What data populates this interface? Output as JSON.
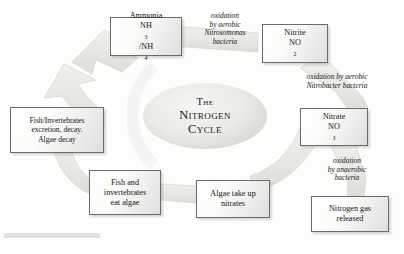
{
  "figure": {
    "title_lines": [
      "The",
      "Nitrogen",
      "Cycle"
    ],
    "center_title_plain": "The Nitrogen Cycle",
    "style": {
      "arrow_fill": "#e7e7e4",
      "arrow_stroke": "#d2d2ce",
      "box_border": "#6b6b6b",
      "text_color": "#141414",
      "background": "#fdfdfc"
    }
  },
  "nodes": [
    {
      "id": "ammonia",
      "line1": "Ammonia",
      "line2_html": "NH3/NH4",
      "line2_base": "NH",
      "line2_sub1": "3",
      "line2_mid": "/NH",
      "line2_sub2": "4"
    },
    {
      "id": "nitrite",
      "line1": "Nitrite",
      "line2_base": "NO",
      "line2_sub1": "2"
    },
    {
      "id": "nitrate",
      "line1": "Nitrate",
      "line2_base": "NO",
      "line2_sub1": "3"
    },
    {
      "id": "nitrogen-gas",
      "line1": "Nitrogen gas",
      "line2": "released"
    },
    {
      "id": "algae-uptake",
      "line1": "Algae take up",
      "line2": "nitrates"
    },
    {
      "id": "fish-eat",
      "line1": "Fish and",
      "line2": "invertebrates",
      "line3": "eat algae"
    },
    {
      "id": "fish-excrete",
      "line1": "Fish/Invertebrates",
      "line2": "excretion, decay.",
      "line3": "Algae decay"
    }
  ],
  "annotations": [
    {
      "id": "nitrosomonas",
      "lines": [
        "oxidation",
        "by aerobic",
        "Nitrosomonas",
        "bacteria"
      ]
    },
    {
      "id": "nitrobacter",
      "lines": [
        "oxidation by aerobic",
        "Nitrobacter bacteria"
      ]
    },
    {
      "id": "anaerobic",
      "lines": [
        "oxidation",
        "by anaerobic",
        "bacteria"
      ]
    }
  ]
}
